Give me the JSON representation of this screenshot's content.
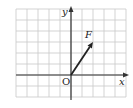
{
  "diagram": {
    "type": "vector-on-grid",
    "grid": {
      "left": 16,
      "top": 9,
      "cell": 11,
      "cols": 10,
      "rows": 8,
      "line_color": "#c8c8c8"
    },
    "origin_cell": {
      "col": 5,
      "row": 6
    },
    "axes": {
      "x_label": "x",
      "y_label": "y",
      "origin_label": "O",
      "color": "#333333"
    },
    "vector": {
      "label": "F",
      "dx": 2,
      "dy": 3,
      "color": "#222222"
    }
  }
}
